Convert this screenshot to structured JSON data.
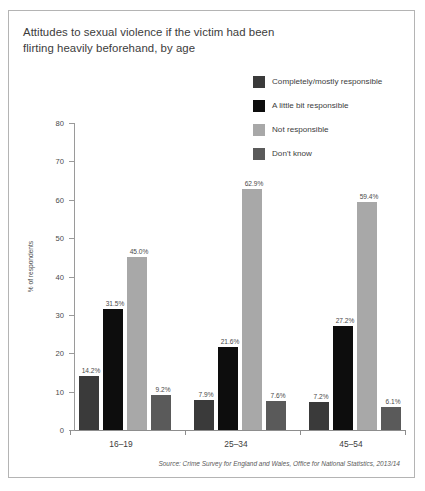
{
  "title": {
    "line1": "Attitudes to sexual violence if the victim had been",
    "line2": "flirting heavily beforehand, by age"
  },
  "legend": {
    "items": [
      {
        "label": "Completely/mostly responsible",
        "color": "#3a3a3a"
      },
      {
        "label": "A little bit responsible",
        "color": "#0d0d0d"
      },
      {
        "label": "Not responsible",
        "color": "#a8a8a8"
      },
      {
        "label": "Don't know",
        "color": "#5a5a5a"
      }
    ]
  },
  "source": "Source: Crime Survey for England and Wales, Office for National Statistics, 2013/14",
  "axis": {
    "y_title": "% of respondents",
    "y_ticks": [
      "0",
      "10",
      "20",
      "30",
      "40",
      "50",
      "60",
      "70",
      "80"
    ]
  },
  "chart_data": {
    "type": "bar",
    "title": "Attitudes to sexual violence if the victim had been flirting heavily beforehand, by age",
    "xlabel": "",
    "ylabel": "% of respondents",
    "ylim": [
      0,
      80
    ],
    "ytick_step": 10,
    "grid": false,
    "legend_position": "top-right",
    "categories": [
      "16–19",
      "25–34",
      "45–54"
    ],
    "series": [
      {
        "name": "Completely/mostly responsible",
        "color": "#3a3a3a",
        "values": [
          14.2,
          7.9,
          7.2
        ],
        "labels": [
          "14.2%",
          "7.9%",
          "7.2%"
        ]
      },
      {
        "name": "A little bit responsible",
        "color": "#0d0d0d",
        "values": [
          31.5,
          21.6,
          27.2
        ],
        "labels": [
          "31.5%",
          "21.6%",
          "27.2%"
        ]
      },
      {
        "name": "Not responsible",
        "color": "#a8a8a8",
        "values": [
          45.0,
          62.9,
          59.4
        ],
        "labels": [
          "45.0%",
          "62.9%",
          "59.4%"
        ]
      },
      {
        "name": "Don't know",
        "color": "#5a5a5a",
        "values": [
          9.2,
          7.6,
          6.1
        ],
        "labels": [
          "9.2%",
          "7.6%",
          "6.1%"
        ]
      }
    ]
  }
}
